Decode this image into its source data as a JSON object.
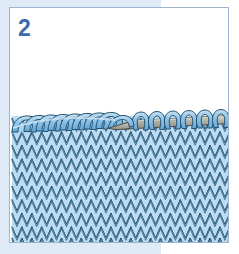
{
  "illustration": {
    "title": "2",
    "step_number": "2",
    "subject": "knitting-bind-off-diagram",
    "description": "Stockinette knit fabric with a chained bind-off edge on the left half and remaining live stitches held on a knitting needle on the right half",
    "caption": "",
    "panel": {
      "x": 9,
      "y": 7,
      "width": 220,
      "height": 236,
      "border_color": "#9fb4cf",
      "background_color": "#ffffff"
    },
    "background_bands": {
      "color": "#dfeaf7",
      "top": {
        "x": 0,
        "y": 0,
        "width": 161,
        "height": 12
      },
      "left": {
        "x": 0,
        "y": 0,
        "width": 12,
        "height": 254
      },
      "bottom": {
        "x": 0,
        "y": 242,
        "width": 161,
        "height": 12
      }
    },
    "colors": {
      "step_number": "#3c6bb0",
      "yarn_fill": "#8fc3e8",
      "yarn_fill_light": "#bfdcf2",
      "yarn_fill_dark": "#5ea4d6",
      "yarn_outline": "#27536f",
      "needle_fill": "#a9a9a0",
      "needle_highlight": "#d6d6cc",
      "needle_outline": "#4d4d48",
      "fabric_background": "#bcdcf4",
      "page_background": "#ffffff",
      "band_blue": "#dfeaf7",
      "frame_border": "#9fb4cf"
    },
    "fabric": {
      "x": 2,
      "y": 100,
      "width": 216,
      "height": 134,
      "stitch_columns": 22,
      "stitch_rows": 10,
      "stitch_width": 9.9,
      "stitch_height": 13.6,
      "stitch_pattern": "stockinette"
    },
    "bind_off_edge": {
      "label": "bound-off chain edge",
      "x_start": 2,
      "x_end": 118,
      "y": 112,
      "chain_loops": 12
    },
    "needle": {
      "label": "knitting-needle",
      "tip_x": 108,
      "tip_y": 118,
      "end_x": 218,
      "end_y": 112,
      "thickness": 8,
      "live_stitches": 7
    }
  }
}
